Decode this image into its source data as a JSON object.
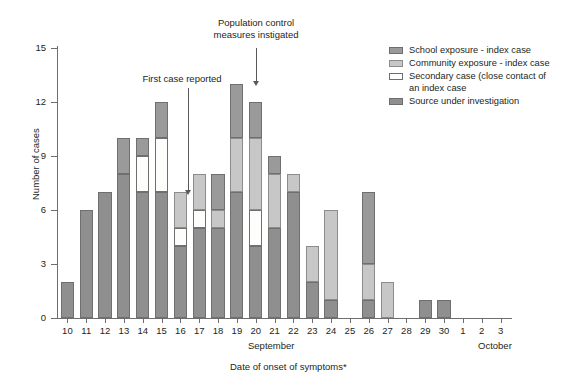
{
  "chart_data": {
    "type": "bar",
    "subtype": "stacked-bar-epidemic-curve",
    "title": "",
    "xlabel": "Date of onset of symptoms*",
    "ylabel": "Number of cases",
    "ylim": [
      0,
      15
    ],
    "yticks": [
      0,
      3,
      6,
      9,
      12,
      15
    ],
    "grid": false,
    "legend_position": "top-right",
    "stack_order_bottom_to_top": [
      "Source under investigation",
      "Secondary case (close contact of an index case",
      "Community exposure - index case",
      "School exposure - index case"
    ],
    "categories": [
      "10",
      "11",
      "12",
      "13",
      "14",
      "15",
      "16",
      "17",
      "18",
      "19",
      "20",
      "21",
      "22",
      "23",
      "24",
      "25",
      "26",
      "27",
      "28",
      "29",
      "30",
      "1",
      "2",
      "3"
    ],
    "month_groups": [
      {
        "label": "September",
        "from": "10",
        "to": "30"
      },
      {
        "label": "October",
        "from": "1",
        "to": "3"
      }
    ],
    "series": [
      {
        "name": "School exposure - index case",
        "color": "#9a9a9a",
        "values": [
          0,
          0,
          0,
          2,
          1,
          2,
          0,
          0,
          2,
          3,
          2,
          1,
          0,
          0,
          0,
          0,
          4,
          0,
          0,
          0,
          0,
          0,
          0,
          0
        ]
      },
      {
        "name": "Community exposure - index case",
        "color": "#c6c7c6",
        "values": [
          0,
          0,
          0,
          0,
          0,
          0,
          2,
          2,
          1,
          3,
          4,
          3,
          1,
          2,
          5,
          0,
          2,
          2,
          0,
          0,
          0,
          0,
          0,
          0
        ]
      },
      {
        "name": "Secondary case (close contact of an index case",
        "color": "#ffffff",
        "values": [
          0,
          0,
          0,
          0,
          2,
          3,
          1,
          1,
          0,
          0,
          2,
          0,
          0,
          0,
          0,
          0,
          0,
          0,
          0,
          0,
          0,
          0,
          0,
          0
        ]
      },
      {
        "name": "Source under investigation",
        "color": "#8e8f8e",
        "values": [
          2,
          6,
          7,
          8,
          7,
          7,
          4,
          5,
          5,
          7,
          4,
          5,
          7,
          2,
          1,
          0,
          1,
          0,
          0,
          1,
          1,
          0,
          0,
          0
        ]
      }
    ],
    "totals": [
      2,
      6,
      7,
      10,
      10,
      12,
      7,
      8,
      8,
      13,
      12,
      9,
      8,
      4,
      6,
      0,
      7,
      2,
      0,
      1,
      1,
      0,
      0,
      0
    ],
    "annotations": [
      {
        "text": "First case reported",
        "points_to_category": "16",
        "text_x": 170,
        "text_y": 77
      },
      {
        "text": "Population control\nmeasures instigated",
        "points_to_category": "19",
        "text_x": 213,
        "text_y": 19
      }
    ]
  },
  "axis": {
    "y_title": "Number of cases",
    "x_title": "Date of onset of symptoms*",
    "y_tick_labels": [
      "15",
      "12",
      "9",
      "6",
      "3",
      "0"
    ],
    "month_september": "September",
    "month_october": "October"
  },
  "legend": {
    "items": [
      {
        "label": "School exposure - index case",
        "swatch": "school"
      },
      {
        "label": "Community exposure - index case",
        "swatch": "community"
      },
      {
        "label": "Secondary case (close contact of",
        "label2": "an index case",
        "swatch": "secondary"
      },
      {
        "label": "Source under investigation",
        "swatch": "source"
      }
    ]
  },
  "annotations": {
    "first_case": "First case reported",
    "pop_control_line1": "Population control",
    "pop_control_line2": "measures instigated"
  },
  "colors": {
    "school": "#9a9a9a",
    "community": "#c6c7c6",
    "secondary": "#ffffff",
    "source": "#8e8f8e",
    "axis": "#6d6e71",
    "text": "#231f20"
  }
}
